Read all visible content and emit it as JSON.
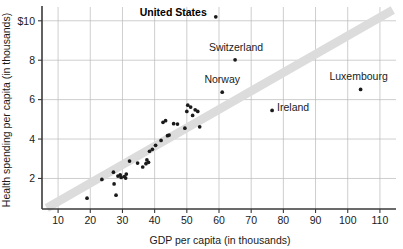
{
  "chart_data": {
    "type": "scatter",
    "title": "",
    "xlabel": "GDP per capita (in thousands)",
    "ylabel": "Health spending per capita (in thousands)",
    "xlim": [
      5,
      115
    ],
    "ylim": [
      0.45,
      10.7
    ],
    "xticks": [
      10,
      20,
      30,
      40,
      50,
      60,
      70,
      80,
      90,
      100,
      110
    ],
    "xticklabels": [
      "10",
      "20",
      "30",
      "40",
      "50",
      "60",
      "70",
      "80",
      "90",
      "100",
      "110"
    ],
    "yticks": [
      2,
      4,
      6,
      8,
      10
    ],
    "yticklabels": [
      "2",
      "4",
      "6",
      "8",
      "$10"
    ],
    "grid": true,
    "grid_axis": "both",
    "legend": "none",
    "trendline": {
      "type": "band",
      "color": "#dcdcdc",
      "x_start": 6.5,
      "y_start": 0.5,
      "x_end": 114,
      "y_end": 10.55
    },
    "points": [
      {
        "x": 19.0,
        "y": 1.0
      },
      {
        "x": 23.6,
        "y": 1.95
      },
      {
        "x": 27.2,
        "y": 2.32
      },
      {
        "x": 27.4,
        "y": 1.72
      },
      {
        "x": 28.0,
        "y": 1.15
      },
      {
        "x": 28.6,
        "y": 2.12
      },
      {
        "x": 29.3,
        "y": 2.18
      },
      {
        "x": 29.6,
        "y": 2.05
      },
      {
        "x": 30.6,
        "y": 2.1
      },
      {
        "x": 31.0,
        "y": 2.02
      },
      {
        "x": 31.2,
        "y": 2.22
      },
      {
        "x": 32.2,
        "y": 2.88
      },
      {
        "x": 34.7,
        "y": 2.78
      },
      {
        "x": 36.3,
        "y": 2.58
      },
      {
        "x": 37.3,
        "y": 2.75
      },
      {
        "x": 37.6,
        "y": 2.94
      },
      {
        "x": 38.1,
        "y": 2.82
      },
      {
        "x": 38.4,
        "y": 3.38
      },
      {
        "x": 39.3,
        "y": 3.48
      },
      {
        "x": 40.3,
        "y": 3.68
      },
      {
        "x": 42.0,
        "y": 3.93
      },
      {
        "x": 42.6,
        "y": 4.85
      },
      {
        "x": 43.4,
        "y": 4.93
      },
      {
        "x": 44.0,
        "y": 4.17
      },
      {
        "x": 44.5,
        "y": 4.2
      },
      {
        "x": 45.9,
        "y": 4.78
      },
      {
        "x": 47.1,
        "y": 4.76
      },
      {
        "x": 49.4,
        "y": 4.55
      },
      {
        "x": 50.0,
        "y": 5.4
      },
      {
        "x": 50.3,
        "y": 5.72
      },
      {
        "x": 51.2,
        "y": 5.62
      },
      {
        "x": 51.8,
        "y": 5.2
      },
      {
        "x": 52.6,
        "y": 5.48
      },
      {
        "x": 53.4,
        "y": 5.4
      },
      {
        "x": 54.0,
        "y": 4.62
      }
    ],
    "labeled_points": [
      {
        "label": "United States",
        "x": 59.0,
        "y": 10.2,
        "bold": true,
        "label_dx": -9,
        "label_dy": -1,
        "anchor": "end"
      },
      {
        "label": "Switzerland",
        "x": 65.0,
        "y": 8.02,
        "bold": false,
        "label_dx": 1,
        "label_dy": -9,
        "anchor": "middle"
      },
      {
        "label": "Norway",
        "x": 61.0,
        "y": 6.38,
        "bold": false,
        "label_dx": 0,
        "label_dy": -9,
        "anchor": "middle"
      },
      {
        "label": "Luxembourg",
        "x": 104.0,
        "y": 6.52,
        "bold": false,
        "label_dx": -2,
        "label_dy": -9,
        "anchor": "middle"
      },
      {
        "label": "Ireland",
        "x": 76.5,
        "y": 5.45,
        "bold": false,
        "label_dx": 5,
        "label_dy": 1,
        "anchor": "start"
      }
    ]
  }
}
